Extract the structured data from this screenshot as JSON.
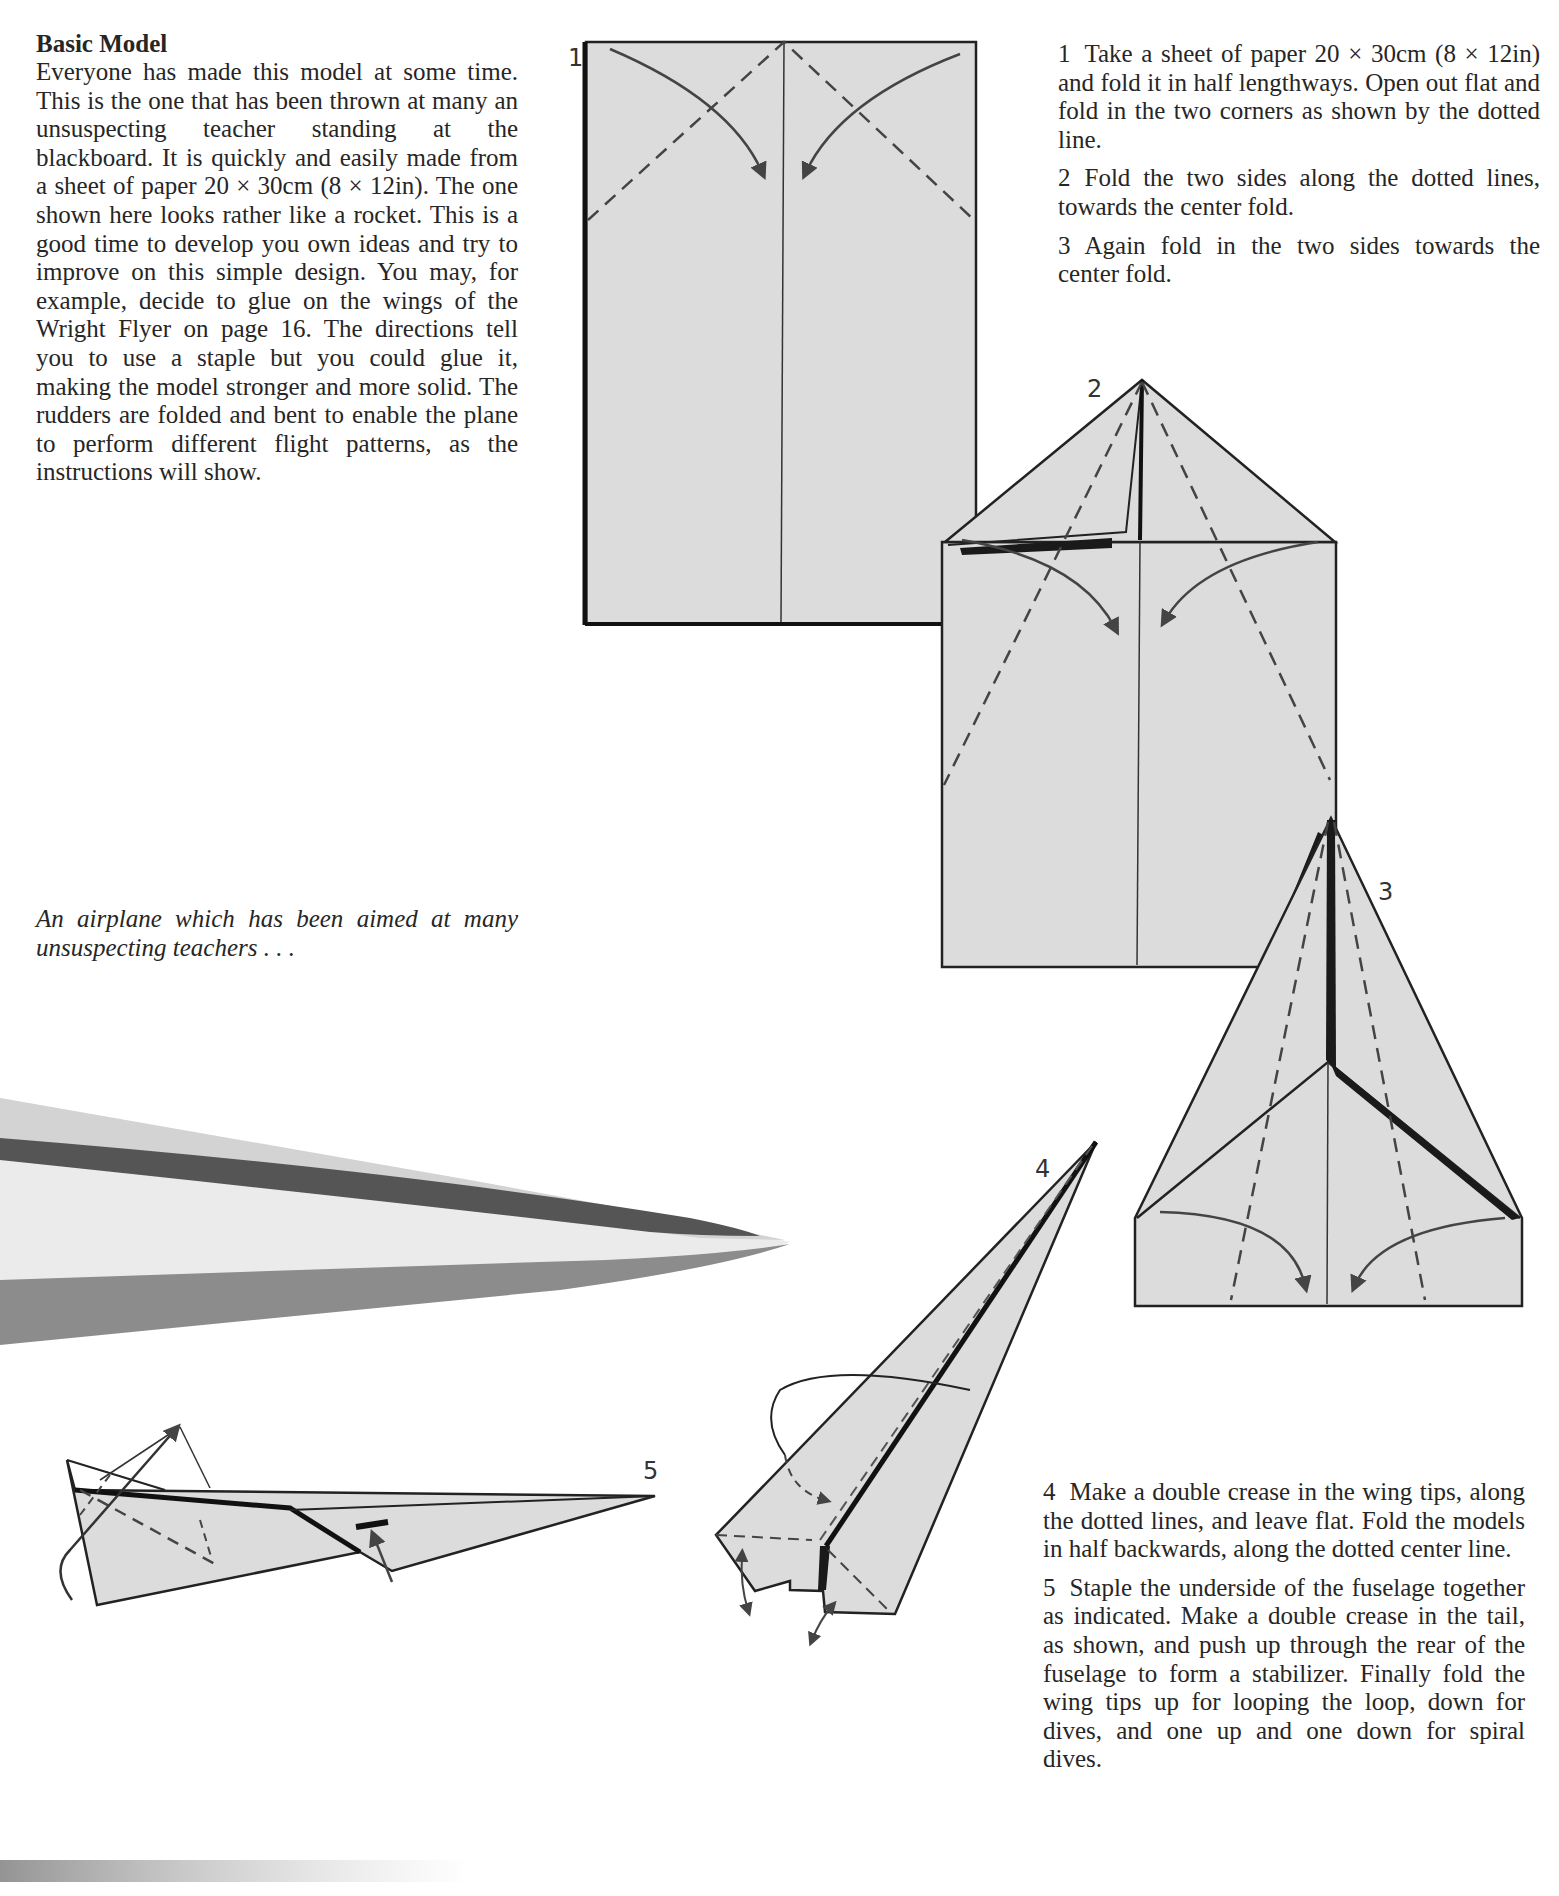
{
  "intro": {
    "heading": "Basic Model",
    "body": "Everyone has made this model at some time. This is the one that has been thrown at many an unsuspecting teacher standing at the blackboard. It is quickly and easily made from a sheet of paper 20 × 30cm (8 × 12in). The one shown here looks rather like a rocket. This is a good time to develop you own ideas and try to improve on this simple design. You may, for example, decide to glue on the wings of the Wright Flyer on page 16. The directions tell you to use a staple but you could glue it, making the model stronger and more solid. The rudders are folded and bent to enable the plane to perform different flight patterns, as the instructions will show."
  },
  "caption": "An airplane which has been aimed at many unsuspecting teachers . . .",
  "steps": [
    {
      "number": "1",
      "text": "Take a sheet of paper 20 × 30cm (8 × 12in) and fold it in half lengthways. Open out flat and fold in the two corners as shown by the dotted line."
    },
    {
      "number": "2",
      "text": "Fold the two sides along the dotted lines, towards the center fold."
    },
    {
      "number": "3",
      "text": "Again fold in the two sides towards the center fold."
    },
    {
      "number": "4",
      "text": "Make a double crease in the wing tips, along the dotted lines, and leave flat. Fold the models in half backwards, along the dotted center line."
    },
    {
      "number": "5",
      "text": "Staple the underside of the fuselage together as indicated. Make a double crease in the tail, as shown, and push up through the rear of the fuselage to form a stabilizer. Finally fold the wing tips up for looping the loop, down for dives, and one up and one down for spiral dives."
    }
  ],
  "diagrams": {
    "labels": [
      "1",
      "2",
      "3",
      "4",
      "5"
    ],
    "paper_color": "#dcdcdc",
    "line_color": "#222222"
  }
}
